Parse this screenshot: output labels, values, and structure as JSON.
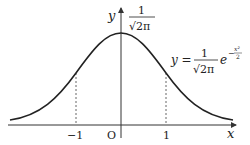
{
  "diagram": {
    "axes": {
      "x_label": "x",
      "y_label": "y",
      "origin_label": "O"
    },
    "ticks": {
      "neg_one": "−1",
      "pos_one": "1"
    },
    "peak_label": {
      "numerator": "1",
      "denominator": "√2π"
    },
    "equation": {
      "lhs": "y =",
      "numerator": "1",
      "denominator": "√2π",
      "base": "e",
      "exponent": "−x²/2",
      "exp_sign": "−",
      "exp_num": "x²",
      "exp_den": "2"
    },
    "colors": {
      "curve": "#222222",
      "axes": "#333333",
      "dashed": "#555555"
    }
  }
}
